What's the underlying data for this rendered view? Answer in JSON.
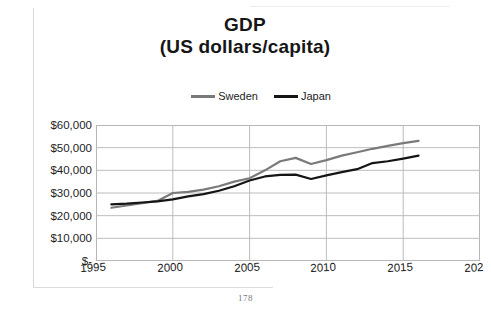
{
  "page": {
    "page_number": "178"
  },
  "chart_data": {
    "type": "line",
    "title": "GDP",
    "subtitle": "(US dollars/capita)",
    "xlabel": "",
    "ylabel": "",
    "xlim": [
      1995,
      2020
    ],
    "ylim": [
      0,
      60000
    ],
    "grid": true,
    "legend_position": "top",
    "x_tick_labels": [
      "1995",
      "2000",
      "2005",
      "2010",
      "2015",
      "202"
    ],
    "x_ticks": [
      1995,
      2000,
      2005,
      2010,
      2015,
      2020
    ],
    "y_tick_labels": [
      "$60,000",
      "$50,000",
      "$40,000",
      "$30,000",
      "$20,000",
      "$10,000",
      "$-"
    ],
    "y_ticks": [
      60000,
      50000,
      40000,
      30000,
      20000,
      10000,
      0
    ],
    "x": [
      1996,
      1997,
      1998,
      1999,
      2000,
      2001,
      2002,
      2003,
      2004,
      2005,
      2006,
      2007,
      2008,
      2009,
      2010,
      2011,
      2012,
      2013,
      2014,
      2015,
      2016
    ],
    "series": [
      {
        "name": "Sweden",
        "color": "#7a7a7a",
        "values": [
          23500,
          24500,
          25500,
          26500,
          30000,
          30500,
          31500,
          33000,
          35000,
          36500,
          40000,
          44000,
          45500,
          42800,
          44500,
          46500,
          48000,
          49500,
          50800,
          52000,
          53000
        ]
      },
      {
        "name": "Japan",
        "color": "#151515",
        "values": [
          25000,
          25300,
          25800,
          26300,
          27200,
          28500,
          29500,
          31000,
          33000,
          35500,
          37300,
          38000,
          38100,
          36200,
          37800,
          39200,
          40500,
          43200,
          44000,
          45200,
          46500
        ]
      }
    ]
  },
  "legend": {
    "items": [
      {
        "label": "Sweden",
        "color": "#7a7a7a"
      },
      {
        "label": "Japan",
        "color": "#151515"
      }
    ]
  }
}
